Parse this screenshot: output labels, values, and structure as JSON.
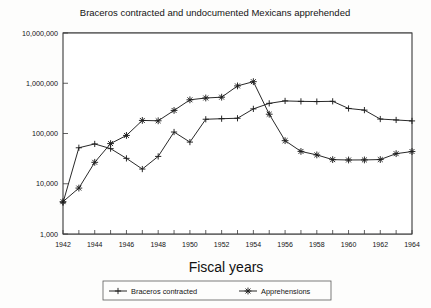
{
  "chart_data": {
    "type": "line",
    "title": "Braceros contracted and undocumented Mexicans apprehended",
    "xlabel": "Fiscal years",
    "ylabel": "",
    "yscale": "log",
    "ylim": [
      1000,
      10000000
    ],
    "xlim": [
      1942,
      1964
    ],
    "grid": true,
    "legend_position": "bottom",
    "ytick_labels": [
      "1,000",
      "10,000",
      "100,000",
      "1,000,000",
      "10,000,000"
    ],
    "ytick_values": [
      1000,
      10000,
      100000,
      1000000,
      10000000
    ],
    "xtick_labels": [
      "1942",
      "1944",
      "1946",
      "1948",
      "1950",
      "1952",
      "1954",
      "1956",
      "1958",
      "1960",
      "1962",
      "1964"
    ],
    "xtick_values": [
      1942,
      1944,
      1946,
      1948,
      1950,
      1952,
      1954,
      1956,
      1958,
      1960,
      1962,
      1964
    ],
    "x": [
      1942,
      1943,
      1944,
      1945,
      1946,
      1947,
      1948,
      1949,
      1950,
      1951,
      1952,
      1953,
      1954,
      1955,
      1956,
      1957,
      1958,
      1959,
      1960,
      1961,
      1962,
      1963,
      1964
    ],
    "series": [
      {
        "name": "Braceros contracted",
        "marker": "plus",
        "values": [
          4200,
          52000,
          62000,
          50000,
          32000,
          19600,
          35000,
          107000,
          67500,
          192000,
          197000,
          201000,
          309000,
          398000,
          445000,
          436000,
          432000,
          437000,
          315000,
          292000,
          194000,
          186000,
          178000
        ]
      },
      {
        "name": "Apprehensions",
        "marker": "asterisk",
        "values": [
          4400,
          8200,
          26700,
          63000,
          91500,
          182000,
          179000,
          288000,
          468000,
          509000,
          528000,
          885000,
          1075000,
          242000,
          72000,
          44000,
          37500,
          30200,
          29700,
          29800,
          30300,
          39700,
          43800
        ]
      }
    ]
  },
  "legend": {
    "items": [
      {
        "label": "Braceros contracted",
        "marker": "plus"
      },
      {
        "label": "Apprehensions",
        "marker": "asterisk"
      }
    ]
  },
  "colors": {
    "ink": "#1d1d1d",
    "major_grid": "#4a4a4a",
    "minor_grid": "#b9b9b9",
    "plot_background": "#ffffff",
    "page_background": "#fdfdfc"
  }
}
